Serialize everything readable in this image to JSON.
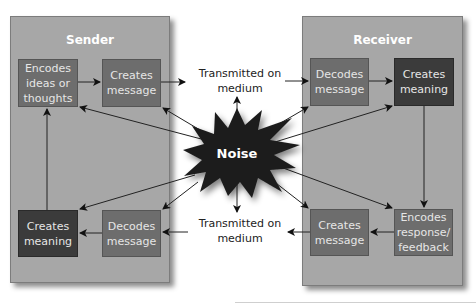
{
  "sender": {
    "title": "Sender",
    "boxes": {
      "encodes": "Encodes\nideas or\nthoughts",
      "creates_message": "Creates\nmessage",
      "creates_meaning": "Creates\nmeaning",
      "decodes": "Decodes\nmessage"
    }
  },
  "receiver": {
    "title": "Receiver",
    "boxes": {
      "decodes": "Decodes\nmessage",
      "creates_meaning": "Creates\nmeaning",
      "creates_message": "Creates\nmessage",
      "encodes": "Encodes\nresponse/\nfeedback"
    }
  },
  "channel": {
    "top_label": "Transmitted on\nmedium",
    "bottom_label": "Transmitted on\nmedium"
  },
  "noise": {
    "label": "Noise"
  },
  "colors": {
    "panel": "#a7a7a7",
    "box_mid": "#6d6d6d",
    "box_dark": "#3b3b3b",
    "noise": "#1e1e1e"
  }
}
